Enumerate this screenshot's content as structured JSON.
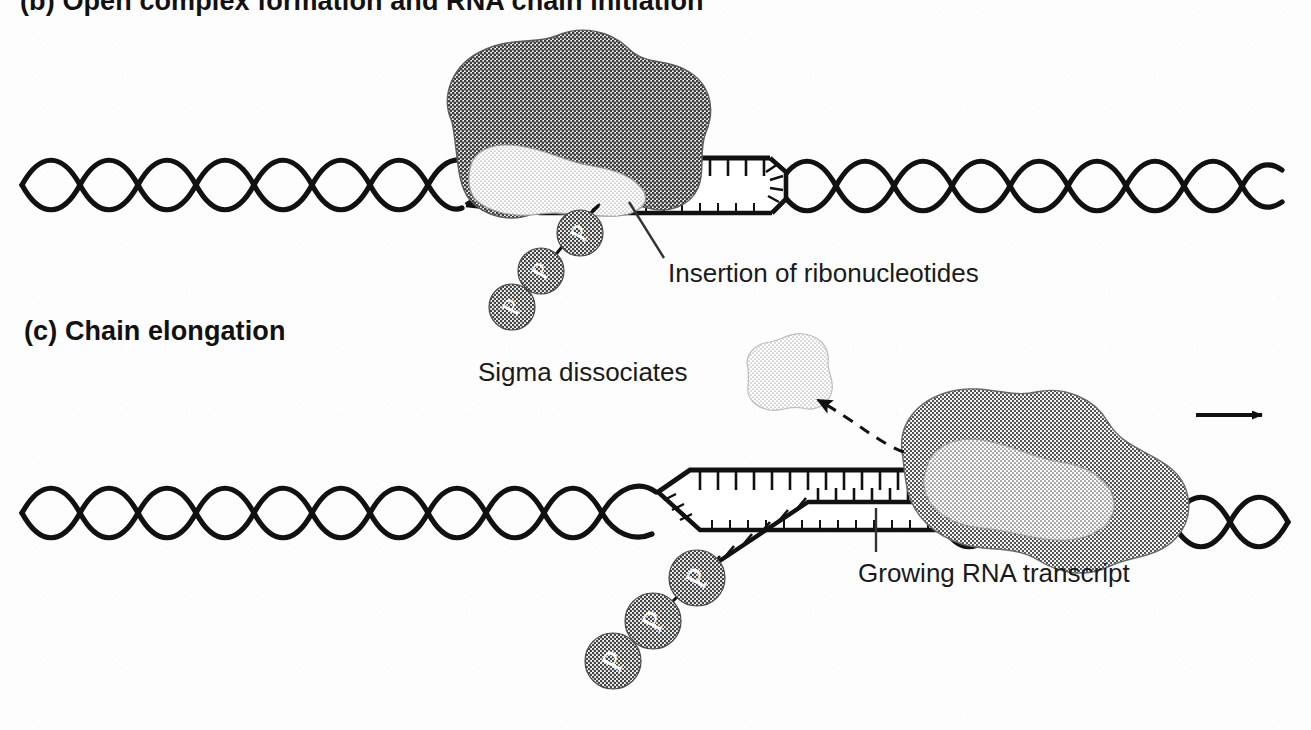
{
  "figure": {
    "background_color": "#fdfdfd",
    "ink_color": "#111111"
  },
  "panels": [
    {
      "id": "b",
      "heading": "(b) Open complex formation and RNA chain initiation",
      "heading_visible_partially": true
    },
    {
      "id": "c",
      "heading": "(c) Chain elongation"
    }
  ],
  "labels": {
    "insertion": "Insertion of ribonucleotides",
    "sigma": "Sigma dissociates",
    "growing": "Growing RNA transcript"
  },
  "molecules": {
    "phosphate_letter": "P",
    "phosphate_count_panel_b": 3,
    "phosphate_count_panel_c": 3,
    "polymerase_name": "RNA polymerase core enzyme",
    "sigma_name": "sigma factor"
  },
  "colors": {
    "polymerase_dark": "#8a8a8a",
    "polymerase_light": "#c9c9c9",
    "sigma_blob": "#d8d8d8",
    "phosphate_fill": "#7d7d7d",
    "phosphate_text": "#ffffff",
    "dna_stroke": "#111111",
    "leader_line": "#333333"
  },
  "annotations": {
    "direction_arrow": "transcription direction, rightward",
    "dashed_arrow": "sigma factor releases from polymerase"
  }
}
